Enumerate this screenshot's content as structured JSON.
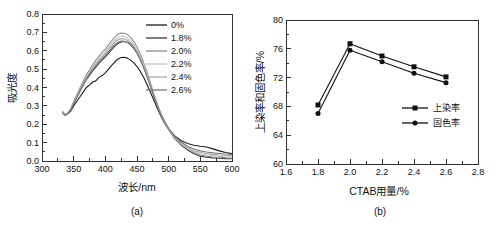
{
  "figure": {
    "background": "#ffffff",
    "panels": [
      {
        "caption": "(a)"
      },
      {
        "caption": "(b)"
      }
    ]
  },
  "chart_data": [
    {
      "type": "line",
      "panel": "a",
      "title": "",
      "xlabel": "波长/nm",
      "ylabel": "吸光度",
      "xlim": [
        300,
        600
      ],
      "ylim": [
        0,
        0.8
      ],
      "xticks": [
        300,
        350,
        400,
        450,
        500,
        550,
        600
      ],
      "xtick_labels": [
        "300",
        "350",
        "400",
        "450",
        "500",
        "550",
        "600"
      ],
      "yticks": [
        0,
        0.1,
        0.2,
        0.3,
        0.4,
        0.5,
        0.6,
        0.7,
        0.8
      ],
      "ytick_labels": [
        "0.0",
        "0.1",
        "0.2",
        "0.3",
        "0.4",
        "0.5",
        "0.6",
        "0.7",
        "0.8"
      ],
      "grid": false,
      "legend_position": "top-right-inside",
      "x": [
        332,
        336,
        340,
        345,
        350,
        355,
        360,
        365,
        370,
        375,
        380,
        385,
        390,
        395,
        400,
        405,
        410,
        415,
        420,
        425,
        430,
        435,
        440,
        445,
        450,
        455,
        460,
        465,
        470,
        475,
        480,
        485,
        490,
        495,
        500,
        510,
        520,
        530,
        540,
        550,
        560,
        570,
        580,
        590,
        600
      ],
      "series": [
        {
          "name": "0%",
          "color": "#1c1c1c",
          "values": [
            0.27,
            0.253,
            0.255,
            0.27,
            0.3,
            0.325,
            0.35,
            0.375,
            0.4,
            0.413,
            0.43,
            0.436,
            0.455,
            0.465,
            0.48,
            0.5,
            0.52,
            0.54,
            0.555,
            0.563,
            0.565,
            0.56,
            0.549,
            0.534,
            0.514,
            0.489,
            0.458,
            0.423,
            0.384,
            0.344,
            0.303,
            0.264,
            0.229,
            0.199,
            0.174,
            0.135,
            0.11,
            0.095,
            0.086,
            0.08,
            0.076,
            0.066,
            0.055,
            0.046,
            0.04
          ]
        },
        {
          "name": "1.8%",
          "color": "#3a3a3a",
          "values": [
            0.266,
            0.25,
            0.254,
            0.274,
            0.31,
            0.345,
            0.38,
            0.412,
            0.442,
            0.466,
            0.49,
            0.511,
            0.531,
            0.55,
            0.566,
            0.586,
            0.606,
            0.625,
            0.64,
            0.648,
            0.65,
            0.646,
            0.635,
            0.616,
            0.59,
            0.556,
            0.516,
            0.47,
            0.421,
            0.37,
            0.32,
            0.274,
            0.234,
            0.2,
            0.17,
            0.12,
            0.085,
            0.06,
            0.04,
            0.026,
            0.021,
            0.017,
            0.015,
            0.013,
            0.012
          ]
        },
        {
          "name": "2.0%",
          "color": "#8c8c8c",
          "values": [
            0.272,
            0.255,
            0.26,
            0.284,
            0.324,
            0.36,
            0.399,
            0.434,
            0.468,
            0.497,
            0.524,
            0.549,
            0.571,
            0.591,
            0.609,
            0.631,
            0.654,
            0.674,
            0.69,
            0.697,
            0.695,
            0.688,
            0.673,
            0.65,
            0.621,
            0.584,
            0.54,
            0.491,
            0.438,
            0.384,
            0.331,
            0.283,
            0.241,
            0.206,
            0.176,
            0.125,
            0.091,
            0.066,
            0.047,
            0.032,
            0.026,
            0.022,
            0.02,
            0.018,
            0.016
          ]
        },
        {
          "name": "2.2%",
          "color": "#c4c4c4",
          "values": [
            0.269,
            0.252,
            0.257,
            0.28,
            0.318,
            0.353,
            0.391,
            0.425,
            0.457,
            0.486,
            0.512,
            0.536,
            0.557,
            0.576,
            0.594,
            0.616,
            0.638,
            0.657,
            0.672,
            0.679,
            0.677,
            0.67,
            0.655,
            0.633,
            0.605,
            0.569,
            0.527,
            0.479,
            0.428,
            0.376,
            0.324,
            0.278,
            0.238,
            0.203,
            0.173,
            0.124,
            0.092,
            0.068,
            0.051,
            0.038,
            0.033,
            0.029,
            0.026,
            0.023,
            0.021
          ]
        },
        {
          "name": "2.4%",
          "color": "#a8a8a8",
          "values": [
            0.267,
            0.251,
            0.255,
            0.278,
            0.314,
            0.349,
            0.386,
            0.419,
            0.451,
            0.479,
            0.504,
            0.527,
            0.548,
            0.567,
            0.585,
            0.606,
            0.627,
            0.646,
            0.66,
            0.666,
            0.664,
            0.657,
            0.643,
            0.622,
            0.595,
            0.56,
            0.519,
            0.472,
            0.422,
            0.371,
            0.321,
            0.276,
            0.237,
            0.203,
            0.174,
            0.127,
            0.096,
            0.073,
            0.057,
            0.046,
            0.041,
            0.036,
            0.033,
            0.031,
            0.029
          ]
        },
        {
          "name": "2.6%",
          "color": "#7a7a7a",
          "values": [
            0.265,
            0.249,
            0.253,
            0.276,
            0.311,
            0.346,
            0.381,
            0.414,
            0.445,
            0.472,
            0.496,
            0.518,
            0.538,
            0.557,
            0.575,
            0.595,
            0.615,
            0.633,
            0.647,
            0.653,
            0.651,
            0.645,
            0.631,
            0.611,
            0.585,
            0.552,
            0.512,
            0.467,
            0.418,
            0.368,
            0.319,
            0.275,
            0.237,
            0.205,
            0.178,
            0.132,
            0.102,
            0.08,
            0.065,
            0.055,
            0.049,
            0.044,
            0.041,
            0.038,
            0.036
          ]
        }
      ]
    },
    {
      "type": "line",
      "panel": "b",
      "title": "",
      "xlabel": "CTAB用量/%",
      "ylabel": "上染率和固色率/%",
      "xlim": [
        1.6,
        2.8
      ],
      "ylim": [
        60,
        80
      ],
      "xticks": [
        1.6,
        1.8,
        2.0,
        2.2,
        2.4,
        2.6,
        2.8
      ],
      "xtick_labels": [
        "1.6",
        "1.8",
        "2.0",
        "2.2",
        "2.4",
        "2.6",
        "2.8"
      ],
      "yticks": [
        60,
        64,
        68,
        72,
        76,
        80
      ],
      "ytick_labels": [
        "60",
        "64",
        "68",
        "72",
        "76",
        "80"
      ],
      "grid": false,
      "legend_position": "right-middle-inside",
      "x": [
        1.8,
        2.0,
        2.2,
        2.4,
        2.6
      ],
      "series": [
        {
          "name": "上染率",
          "marker": "square",
          "color": "#111111",
          "values": [
            68.2,
            76.7,
            75.0,
            73.5,
            72.1
          ]
        },
        {
          "name": "固色率",
          "marker": "circle",
          "color": "#111111",
          "values": [
            67.0,
            75.8,
            74.2,
            72.6,
            71.3
          ]
        }
      ]
    }
  ]
}
